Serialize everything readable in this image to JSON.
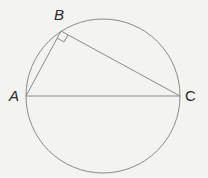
{
  "diagram": {
    "type": "geometry-inscribed-right-triangle",
    "circle": {
      "cx": 103,
      "cy": 96,
      "r": 77
    },
    "points": {
      "A": {
        "label": "A",
        "x": 26,
        "y": 96
      },
      "B": {
        "label": "B",
        "x": 61,
        "y": 31
      },
      "C": {
        "label": "C",
        "x": 180,
        "y": 96
      }
    },
    "right_angle_at": "B",
    "segments": [
      "AB",
      "BC",
      "AC"
    ],
    "colors": {
      "line": "#8a8a8a",
      "label": "#2a2a2a",
      "background": "#f3f3f1"
    }
  }
}
